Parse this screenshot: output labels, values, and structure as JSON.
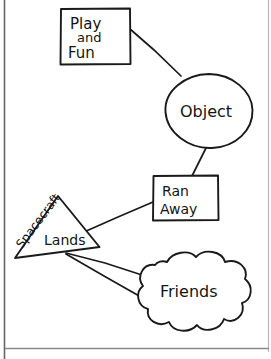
{
  "diagram": {
    "stroke_color": "#1a1a1a",
    "background_color": "#ffffff",
    "border_color": "#555555",
    "nodes": [
      {
        "id": "play-and-fun",
        "shape": "rectangle",
        "lines": [
          "Play",
          "and",
          "Fun"
        ],
        "line1": "Play",
        "line2": "and",
        "line3": "Fun"
      },
      {
        "id": "object",
        "shape": "circle",
        "label": "Object"
      },
      {
        "id": "ran-away",
        "shape": "rectangle",
        "lines": [
          "Ran",
          "Away"
        ],
        "line1": "Ran",
        "line2": "Away"
      },
      {
        "id": "spacecraft-lands",
        "shape": "triangle",
        "label_rotated": "Spacecraft",
        "label_horizontal": "Lands"
      },
      {
        "id": "friends",
        "shape": "cloud",
        "label": "Friends"
      }
    ],
    "connectors": [
      {
        "from": "play-and-fun",
        "to": "object"
      },
      {
        "from": "object",
        "to": "ran-away"
      },
      {
        "from": "ran-away",
        "to": "spacecraft-lands"
      },
      {
        "from": "spacecraft-lands",
        "to": "friends"
      },
      {
        "from": "spacecraft-lands",
        "to": "friends"
      }
    ]
  }
}
